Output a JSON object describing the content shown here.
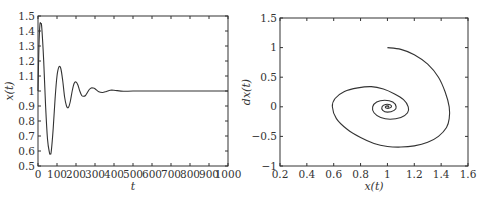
{
  "chart_data": [
    {
      "type": "line",
      "title": "",
      "xlabel": "t",
      "ylabel": "x(t)",
      "xlim": [
        0,
        1000
      ],
      "ylim": [
        0.5,
        1.5
      ],
      "xticks": [
        0,
        100,
        200,
        300,
        400,
        500,
        600,
        700,
        800,
        900,
        1000
      ],
      "xtick_labels": [
        "0",
        "100",
        "200",
        "300",
        "400",
        "500",
        "600",
        "700",
        "800",
        "900",
        "1000"
      ],
      "yticks": [
        0.5,
        0.6,
        0.7,
        0.8,
        0.9,
        1,
        1.1,
        1.2,
        1.3,
        1.4,
        1.5
      ],
      "ytick_labels": [
        "0.5",
        "0.6",
        "0.7",
        "0.8",
        "0.9",
        "1",
        "1.1",
        "1.2",
        "1.3",
        "1.4",
        "1.5"
      ],
      "grid": false,
      "legend": null,
      "series": [
        {
          "name": "x(t)",
          "x": [
            0,
            5,
            10,
            15,
            20,
            30,
            40,
            50,
            60,
            65,
            70,
            80,
            90,
            100,
            110,
            120,
            130,
            140,
            150,
            160,
            170,
            180,
            190,
            200,
            210,
            220,
            230,
            240,
            250,
            260,
            270,
            280,
            290,
            300,
            320,
            340,
            360,
            380,
            400,
            450,
            500,
            600,
            700,
            800,
            900,
            1000
          ],
          "values": [
            1.0,
            1.3,
            1.44,
            1.45,
            1.42,
            1.2,
            0.9,
            0.68,
            0.59,
            0.58,
            0.6,
            0.75,
            0.95,
            1.1,
            1.16,
            1.15,
            1.07,
            0.96,
            0.9,
            0.89,
            0.93,
            1.0,
            1.05,
            1.06,
            1.04,
            1.0,
            0.97,
            0.965,
            0.97,
            0.99,
            1.01,
            1.02,
            1.02,
            1.015,
            0.995,
            0.99,
            0.997,
            1.005,
            1.005,
            0.998,
            1.0,
            1.0,
            1.0,
            1.0,
            1.0,
            1.0
          ]
        }
      ]
    },
    {
      "type": "line",
      "title": "",
      "xlabel": "x(t)",
      "ylabel": "dx(t)",
      "xlim": [
        0.2,
        1.6
      ],
      "ylim": [
        -1,
        1.5
      ],
      "xticks": [
        0.2,
        0.4,
        0.6,
        0.8,
        1,
        1.2,
        1.4,
        1.6
      ],
      "xtick_labels": [
        "0.2",
        "0.4",
        "0.6",
        "0.8",
        "1",
        "1.2",
        "1.4",
        "1.6"
      ],
      "yticks": [
        -1,
        -0.5,
        0,
        0.5,
        1,
        1.5
      ],
      "ytick_labels": [
        "−1",
        "−0.5",
        "0",
        "0.5",
        "1",
        "1.5"
      ],
      "grid": false,
      "legend": null,
      "series": [
        {
          "name": "phase trajectory",
          "x": [
            1.0,
            1.1,
            1.2,
            1.3,
            1.38,
            1.43,
            1.46,
            1.46,
            1.44,
            1.38,
            1.3,
            1.2,
            1.1,
            1.0,
            0.9,
            0.8,
            0.7,
            0.62,
            0.59,
            0.61,
            0.68,
            0.78,
            0.88,
            0.97,
            1.05,
            1.12,
            1.155,
            1.15,
            1.1,
            1.02,
            0.95,
            0.9,
            0.89,
            0.92,
            0.98,
            1.04,
            1.065,
            1.05,
            1.0,
            0.965,
            0.96,
            0.985,
            1.02,
            1.03,
            1.01,
            0.99,
            0.985,
            1.0,
            1.01,
            1.0
          ],
          "values": [
            1.0,
            0.97,
            0.88,
            0.72,
            0.5,
            0.25,
            0.0,
            -0.2,
            -0.35,
            -0.5,
            -0.6,
            -0.66,
            -0.68,
            -0.67,
            -0.62,
            -0.52,
            -0.38,
            -0.2,
            0.0,
            0.14,
            0.26,
            0.32,
            0.34,
            0.3,
            0.22,
            0.12,
            0.0,
            -0.1,
            -0.18,
            -0.21,
            -0.18,
            -0.1,
            0.0,
            0.08,
            0.11,
            0.08,
            0.0,
            -0.06,
            -0.09,
            -0.06,
            0.0,
            0.04,
            0.035,
            0.0,
            -0.025,
            -0.02,
            0.0,
            0.015,
            0.0,
            0.0
          ]
        }
      ]
    }
  ],
  "left_plot": {
    "xlabel": "t",
    "ylabel": "x(t)"
  },
  "right_plot": {
    "xlabel": "x(t)",
    "ylabel": "dx(t)"
  }
}
